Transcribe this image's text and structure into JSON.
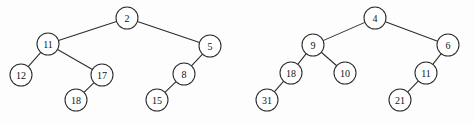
{
  "figure": {
    "background_color": "#fdfdfd",
    "stroke_color": "#2b2b2b",
    "node_fill_color": "#ffffff",
    "label_color": "#111111",
    "node_radius": 11,
    "width": 475,
    "height": 123
  },
  "diagrams": [
    {
      "id": "left-tree",
      "name": "binary-tree-left",
      "root": "2",
      "nodes": [
        {
          "id": "L2",
          "label": "2",
          "cx": 127,
          "cy": 18
        },
        {
          "id": "L11",
          "label": "11",
          "cx": 48,
          "cy": 44
        },
        {
          "id": "L5",
          "label": "5",
          "cx": 210,
          "cy": 46
        },
        {
          "id": "L12",
          "label": "12",
          "cx": 21,
          "cy": 75
        },
        {
          "id": "L17",
          "label": "17",
          "cx": 102,
          "cy": 75
        },
        {
          "id": "L8",
          "label": "8",
          "cx": 184,
          "cy": 74
        },
        {
          "id": "L18",
          "label": "18",
          "cx": 76,
          "cy": 100
        },
        {
          "id": "L15",
          "label": "15",
          "cx": 157,
          "cy": 100
        }
      ],
      "edges": [
        {
          "from": "L2",
          "to": "L11"
        },
        {
          "from": "L2",
          "to": "L5"
        },
        {
          "from": "L11",
          "to": "L12"
        },
        {
          "from": "L11",
          "to": "L17"
        },
        {
          "from": "L17",
          "to": "L18"
        },
        {
          "from": "L5",
          "to": "L8"
        },
        {
          "from": "L8",
          "to": "L15"
        }
      ]
    },
    {
      "id": "right-tree",
      "name": "binary-tree-right",
      "root": "4",
      "nodes": [
        {
          "id": "R4",
          "label": "4",
          "cx": 375,
          "cy": 18
        },
        {
          "id": "R9",
          "label": "9",
          "cx": 313,
          "cy": 45
        },
        {
          "id": "R6",
          "label": "6",
          "cx": 448,
          "cy": 45
        },
        {
          "id": "R18",
          "label": "18",
          "cx": 291,
          "cy": 73
        },
        {
          "id": "R10",
          "label": "10",
          "cx": 345,
          "cy": 73
        },
        {
          "id": "R11",
          "label": "11",
          "cx": 426,
          "cy": 73
        },
        {
          "id": "R31",
          "label": "31",
          "cx": 267,
          "cy": 100
        },
        {
          "id": "R21",
          "label": "21",
          "cx": 400,
          "cy": 100
        }
      ],
      "edges": [
        {
          "from": "R4",
          "to": "R9"
        },
        {
          "from": "R4",
          "to": "R6"
        },
        {
          "from": "R9",
          "to": "R18"
        },
        {
          "from": "R9",
          "to": "R10"
        },
        {
          "from": "R18",
          "to": "R31"
        },
        {
          "from": "R6",
          "to": "R11"
        },
        {
          "from": "R11",
          "to": "R21"
        }
      ]
    }
  ]
}
